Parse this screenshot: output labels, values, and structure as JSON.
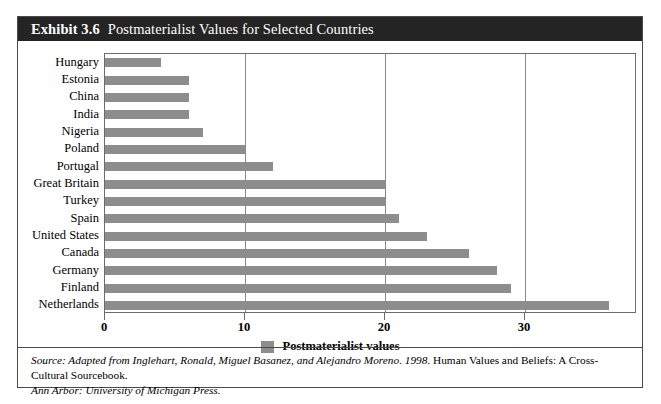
{
  "exhibit": {
    "number": "Exhibit 3.6",
    "title": "Postmaterialist Values for Selected Countries"
  },
  "legend": {
    "label": "Postmaterialist values",
    "swatch_color": "#8d8d8d"
  },
  "source": {
    "italic_part": "Source: Adapted from Inglehart, Ronald, Miguel Basanez, and Alejandro Moreno. 1998.",
    "roman_part": " Human Values and Beliefs: A Cross-Cultural Sourcebook.",
    "line2_italic": "Ann Arbor: University of Michigan Press."
  },
  "chart_data": {
    "type": "bar",
    "orientation": "horizontal",
    "title": "Postmaterialist Values for Selected Countries",
    "xlabel": "",
    "ylabel": "",
    "xlim": [
      0,
      38
    ],
    "ticks": [
      0,
      10,
      20,
      30
    ],
    "tick_labels": [
      "0",
      "10",
      "20",
      "30"
    ],
    "grid": "vertical gridlines at 10, 20, 30",
    "legend_position": "bottom-center",
    "series_name": "Postmaterialist values",
    "bar_color": "#8d8d8d",
    "categories": [
      "Hungary",
      "Estonia",
      "China",
      "India",
      "Nigeria",
      "Poland",
      "Portugal",
      "Great Britain",
      "Turkey",
      "Spain",
      "United States",
      "Canada",
      "Germany",
      "Finland",
      "Netherlands"
    ],
    "values": [
      4,
      6,
      6,
      6,
      7,
      10,
      12,
      20,
      20,
      21,
      23,
      26,
      28,
      29,
      36
    ]
  }
}
